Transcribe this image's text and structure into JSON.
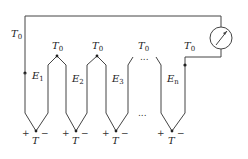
{
  "diagram": {
    "reference_label": "T",
    "reference_sub": "0",
    "junction_label": "T",
    "ellipsis": "...",
    "plus": "+",
    "minus": "−",
    "emf_labels": [
      {
        "main": "E",
        "sub": "1"
      },
      {
        "main": "E",
        "sub": "2"
      },
      {
        "main": "E",
        "sub": "3"
      },
      {
        "main": "E",
        "sub": "n"
      }
    ],
    "meter": "voltmeter-icon",
    "colors": {
      "line": "#444444",
      "text": "#222222"
    }
  }
}
